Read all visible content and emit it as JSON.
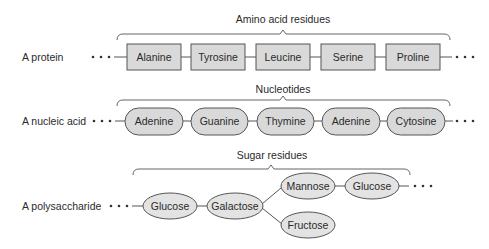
{
  "rows": [
    {
      "label": "A protein",
      "group_label": "Amino acid residues",
      "shape": "rectangle",
      "nodes": [
        "Alanine",
        "Tyrosine",
        "Leucine",
        "Serine",
        "Proline"
      ]
    },
    {
      "label": "A nucleic acid",
      "group_label": "Nucleotides",
      "shape": "pill",
      "nodes": [
        "Adenine",
        "Guanine",
        "Thymine",
        "Adenine",
        "Cytosine"
      ]
    },
    {
      "label": "A polysaccharide",
      "group_label": "Sugar residues",
      "shape": "ellipse",
      "nodes": [
        "Glucose",
        "Galactose",
        "Mannose",
        "Glucose",
        "Fructose"
      ],
      "branching": {
        "Galactose": [
          "Mannose",
          "Fructose"
        ],
        "Mannose": [
          "Glucose"
        ]
      }
    }
  ],
  "continuation": "• • •",
  "colors": {
    "fill": "#d9d9d9",
    "stroke": "#555555",
    "text": "#2a2a2a"
  }
}
